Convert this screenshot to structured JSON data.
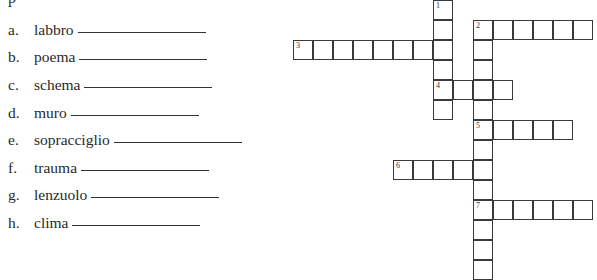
{
  "exercise": {
    "top_fragment": "p",
    "items": [
      {
        "letter": "a.",
        "word": "labbro",
        "top": 21,
        "line_width": 128
      },
      {
        "letter": "b.",
        "word": "poema",
        "top": 48,
        "line_width": 128
      },
      {
        "letter": "c.",
        "word": "schema",
        "top": 76,
        "line_width": 128
      },
      {
        "letter": "d.",
        "word": "muro",
        "top": 104,
        "line_width": 128
      },
      {
        "letter": "e.",
        "word": "sopracciglio",
        "top": 131,
        "line_width": 128
      },
      {
        "letter": "f.",
        "word": "trauma",
        "top": 159,
        "line_width": 128
      },
      {
        "letter": "g.",
        "word": "lenzuolo",
        "top": 186,
        "line_width": 128
      },
      {
        "letter": "h.",
        "word": "clima",
        "top": 214,
        "line_width": 128
      }
    ]
  },
  "crossword": {
    "cell_size": 20,
    "origin_x": 293,
    "origin_y": 0,
    "entries": [
      {
        "number": "1",
        "direction": "down",
        "col": 7,
        "row": 0,
        "length": 6
      },
      {
        "number": "2",
        "direction": "across",
        "col": 9,
        "row": 1,
        "length": 6
      },
      {
        "number": "",
        "direction": "down",
        "col": 9,
        "row": 1,
        "length": 13
      },
      {
        "number": "3",
        "direction": "across",
        "col": 0,
        "row": 2,
        "length": 8
      },
      {
        "number": "4",
        "direction": "across",
        "col": 7,
        "row": 4,
        "length": 4
      },
      {
        "number": "5",
        "direction": "across",
        "col": 9,
        "row": 6,
        "length": 5
      },
      {
        "number": "6",
        "direction": "across",
        "col": 5,
        "row": 8,
        "length": 5
      },
      {
        "number": "7",
        "direction": "across",
        "col": 9,
        "row": 10,
        "length": 6
      }
    ]
  }
}
